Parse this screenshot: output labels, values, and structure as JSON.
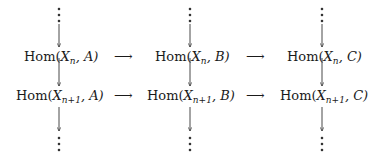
{
  "diagram": {
    "rows": [
      {
        "index_label": "n",
        "nodes": [
          {
            "hom": "Hom(",
            "var": "X",
            "sub": "n",
            "obj": ", A)"
          },
          {
            "hom": "Hom(",
            "var": "X",
            "sub": "n",
            "obj": ", B)"
          },
          {
            "hom": "Hom(",
            "var": "X",
            "sub": "n",
            "obj": ", C)"
          }
        ]
      },
      {
        "index_label": "n+1",
        "nodes": [
          {
            "hom": "Hom(",
            "var": "X",
            "sub": "n+1",
            "obj": ", A)"
          },
          {
            "hom": "Hom(",
            "var": "X",
            "sub": "n+1",
            "obj": ", B)"
          },
          {
            "hom": "Hom(",
            "var": "X",
            "sub": "n+1",
            "obj": ", C)"
          }
        ]
      }
    ],
    "horizontal_arrow": "⟶",
    "vertical_ellipsis": "⋮",
    "colors": {
      "ink": "#1a1a1a",
      "background": "#ffffff"
    }
  }
}
